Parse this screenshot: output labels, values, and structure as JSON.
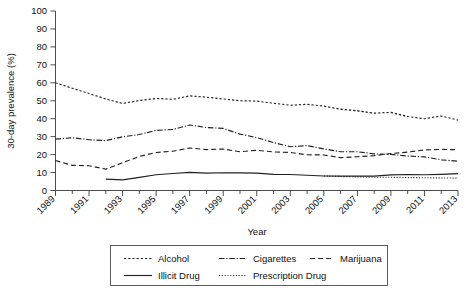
{
  "chart_data": {
    "type": "line",
    "title": "",
    "xlabel": "Year",
    "ylabel": "30-day prevalence (%)",
    "xlim": [
      1989,
      2013
    ],
    "ylim": [
      0,
      100
    ],
    "ytick_step": 10,
    "grid": false,
    "legend_position": "below-plot",
    "x": [
      1989,
      1990,
      1991,
      1992,
      1993,
      1994,
      1995,
      1996,
      1997,
      1998,
      1999,
      2000,
      2001,
      2002,
      2003,
      2004,
      2005,
      2006,
      2007,
      2008,
      2009,
      2010,
      2011,
      2012,
      2013
    ],
    "xticks": [
      1989,
      1991,
      1993,
      1995,
      1997,
      1999,
      2001,
      2003,
      2005,
      2007,
      2009,
      2011,
      2013
    ],
    "xticklabels": [
      "1989",
      "1991",
      "1993",
      "1995",
      "1997",
      "1999",
      "2001",
      "2003",
      "2005",
      "2007",
      "2009",
      "2011",
      "2013"
    ],
    "yticks": [
      0,
      10,
      20,
      30,
      40,
      50,
      60,
      70,
      80,
      90,
      100
    ],
    "yticklabels": [
      "0",
      "10",
      "20",
      "30",
      "40",
      "50",
      "60",
      "70",
      "80",
      "90",
      "100"
    ],
    "series": [
      {
        "name": "Alcohol",
        "linestyle": "dotted-dash",
        "x": [
          1989,
          1990,
          1991,
          1992,
          1993,
          1994,
          1995,
          1996,
          1997,
          1998,
          1999,
          2000,
          2001,
          2002,
          2003,
          2004,
          2005,
          2006,
          2007,
          2008,
          2009,
          2010,
          2011,
          2012,
          2013
        ],
        "values": [
          60.0,
          57.0,
          54.0,
          51.0,
          48.5,
          50.1,
          51.3,
          50.8,
          52.7,
          52.0,
          51.0,
          50.0,
          49.8,
          48.6,
          47.5,
          48.0,
          47.0,
          45.3,
          44.4,
          43.1,
          43.5,
          41.2,
          40.0,
          41.5,
          39.2
        ]
      },
      {
        "name": "Cigarettes",
        "linestyle": "dash-dot",
        "x": [
          1989,
          1990,
          1991,
          1992,
          1993,
          1994,
          1995,
          1996,
          1997,
          1998,
          1999,
          2000,
          2001,
          2002,
          2003,
          2004,
          2005,
          2006,
          2007,
          2008,
          2009,
          2010,
          2011,
          2012,
          2013
        ],
        "values": [
          28.6,
          29.4,
          28.3,
          27.8,
          29.9,
          31.2,
          33.5,
          34.0,
          36.5,
          35.1,
          34.6,
          31.4,
          29.5,
          26.7,
          24.4,
          25.0,
          23.2,
          21.6,
          21.6,
          20.4,
          20.1,
          19.2,
          18.7,
          17.1,
          16.3
        ]
      },
      {
        "name": "Marijuana",
        "linestyle": "dashed",
        "x": [
          1989,
          1990,
          1991,
          1992,
          1993,
          1994,
          1995,
          1996,
          1997,
          1998,
          1999,
          2000,
          2001,
          2002,
          2003,
          2004,
          2005,
          2006,
          2007,
          2008,
          2009,
          2010,
          2011,
          2012,
          2013
        ],
        "values": [
          16.7,
          14.0,
          13.8,
          11.9,
          15.5,
          19.0,
          21.2,
          21.9,
          23.7,
          22.8,
          23.1,
          21.6,
          22.4,
          21.5,
          21.2,
          19.9,
          19.8,
          18.3,
          18.8,
          19.4,
          20.6,
          21.4,
          22.6,
          22.9,
          22.7
        ]
      },
      {
        "name": "Illicit Drug",
        "linestyle": "solid",
        "x": [
          1992,
          1993,
          1994,
          1995,
          1996,
          1997,
          1998,
          1999,
          2000,
          2001,
          2002,
          2003,
          2004,
          2005,
          2006,
          2007,
          2008,
          2009,
          2010,
          2011,
          2012,
          2013
        ],
        "values": [
          6.3,
          5.9,
          7.3,
          8.8,
          9.5,
          10.1,
          9.7,
          9.9,
          9.8,
          9.7,
          9.0,
          8.9,
          8.5,
          8.1,
          8.0,
          8.0,
          8.0,
          8.7,
          8.9,
          8.8,
          9.0,
          9.4
        ]
      },
      {
        "name": "Prescription Drug",
        "linestyle": "fine-dotted",
        "x": [
          2005,
          2006,
          2007,
          2008,
          2009,
          2010,
          2011,
          2012,
          2013
        ],
        "values": [
          8.1,
          7.8,
          7.6,
          7.4,
          7.4,
          7.2,
          7.1,
          7.0,
          6.9
        ]
      }
    ],
    "annotations": []
  },
  "legend": {
    "entries": [
      {
        "label": "Alcohol",
        "style_key": "alcohol"
      },
      {
        "label": "Cigarettes",
        "style_key": "cigarettes"
      },
      {
        "label": "Marijuana",
        "style_key": "marijuana"
      },
      {
        "label": "Illicit Drug",
        "style_key": "illicit"
      },
      {
        "label": "Prescription Drug",
        "style_key": "prescription"
      }
    ]
  },
  "colors": {
    "axis": "#3a3a3a",
    "line": "#222222",
    "background": "#ffffff",
    "tint_green": "#49a05a",
    "tint_magenta": "#a0458f"
  }
}
